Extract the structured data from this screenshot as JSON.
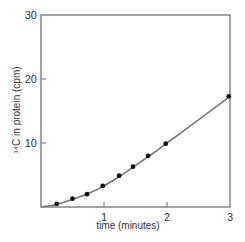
{
  "chart_data": {
    "type": "line",
    "title": "",
    "xlabel": "time (minutes)",
    "ylabel": "¹⁴C in protein (cpm)",
    "xlim": [
      0,
      3
    ],
    "ylim": [
      0,
      30
    ],
    "x_ticks": [
      "1",
      "2",
      "3"
    ],
    "y_ticks": [
      "10",
      "20",
      "30"
    ],
    "grid": false,
    "legend": null,
    "series": [
      {
        "name": "measured",
        "style": "markers",
        "x": [
          0.25,
          0.5,
          0.73,
          0.98,
          1.24,
          1.46,
          1.7,
          1.98,
          2.98
        ],
        "y": [
          0.5,
          1.3,
          2.0,
          3.3,
          4.9,
          6.3,
          8.0,
          9.9,
          17.3
        ]
      },
      {
        "name": "fit",
        "style": "smooth-line",
        "x": [
          0,
          0.25,
          0.5,
          0.75,
          1.0,
          1.25,
          1.5,
          1.75,
          2.0,
          2.5,
          3.0
        ],
        "y": [
          0,
          0.4,
          1.2,
          2.1,
          3.3,
          4.8,
          6.5,
          8.2,
          10.0,
          13.6,
          17.3
        ]
      }
    ]
  },
  "colors": {
    "axis": "#666666",
    "line": "#777777",
    "marker": "#111111",
    "text": "#333333"
  }
}
